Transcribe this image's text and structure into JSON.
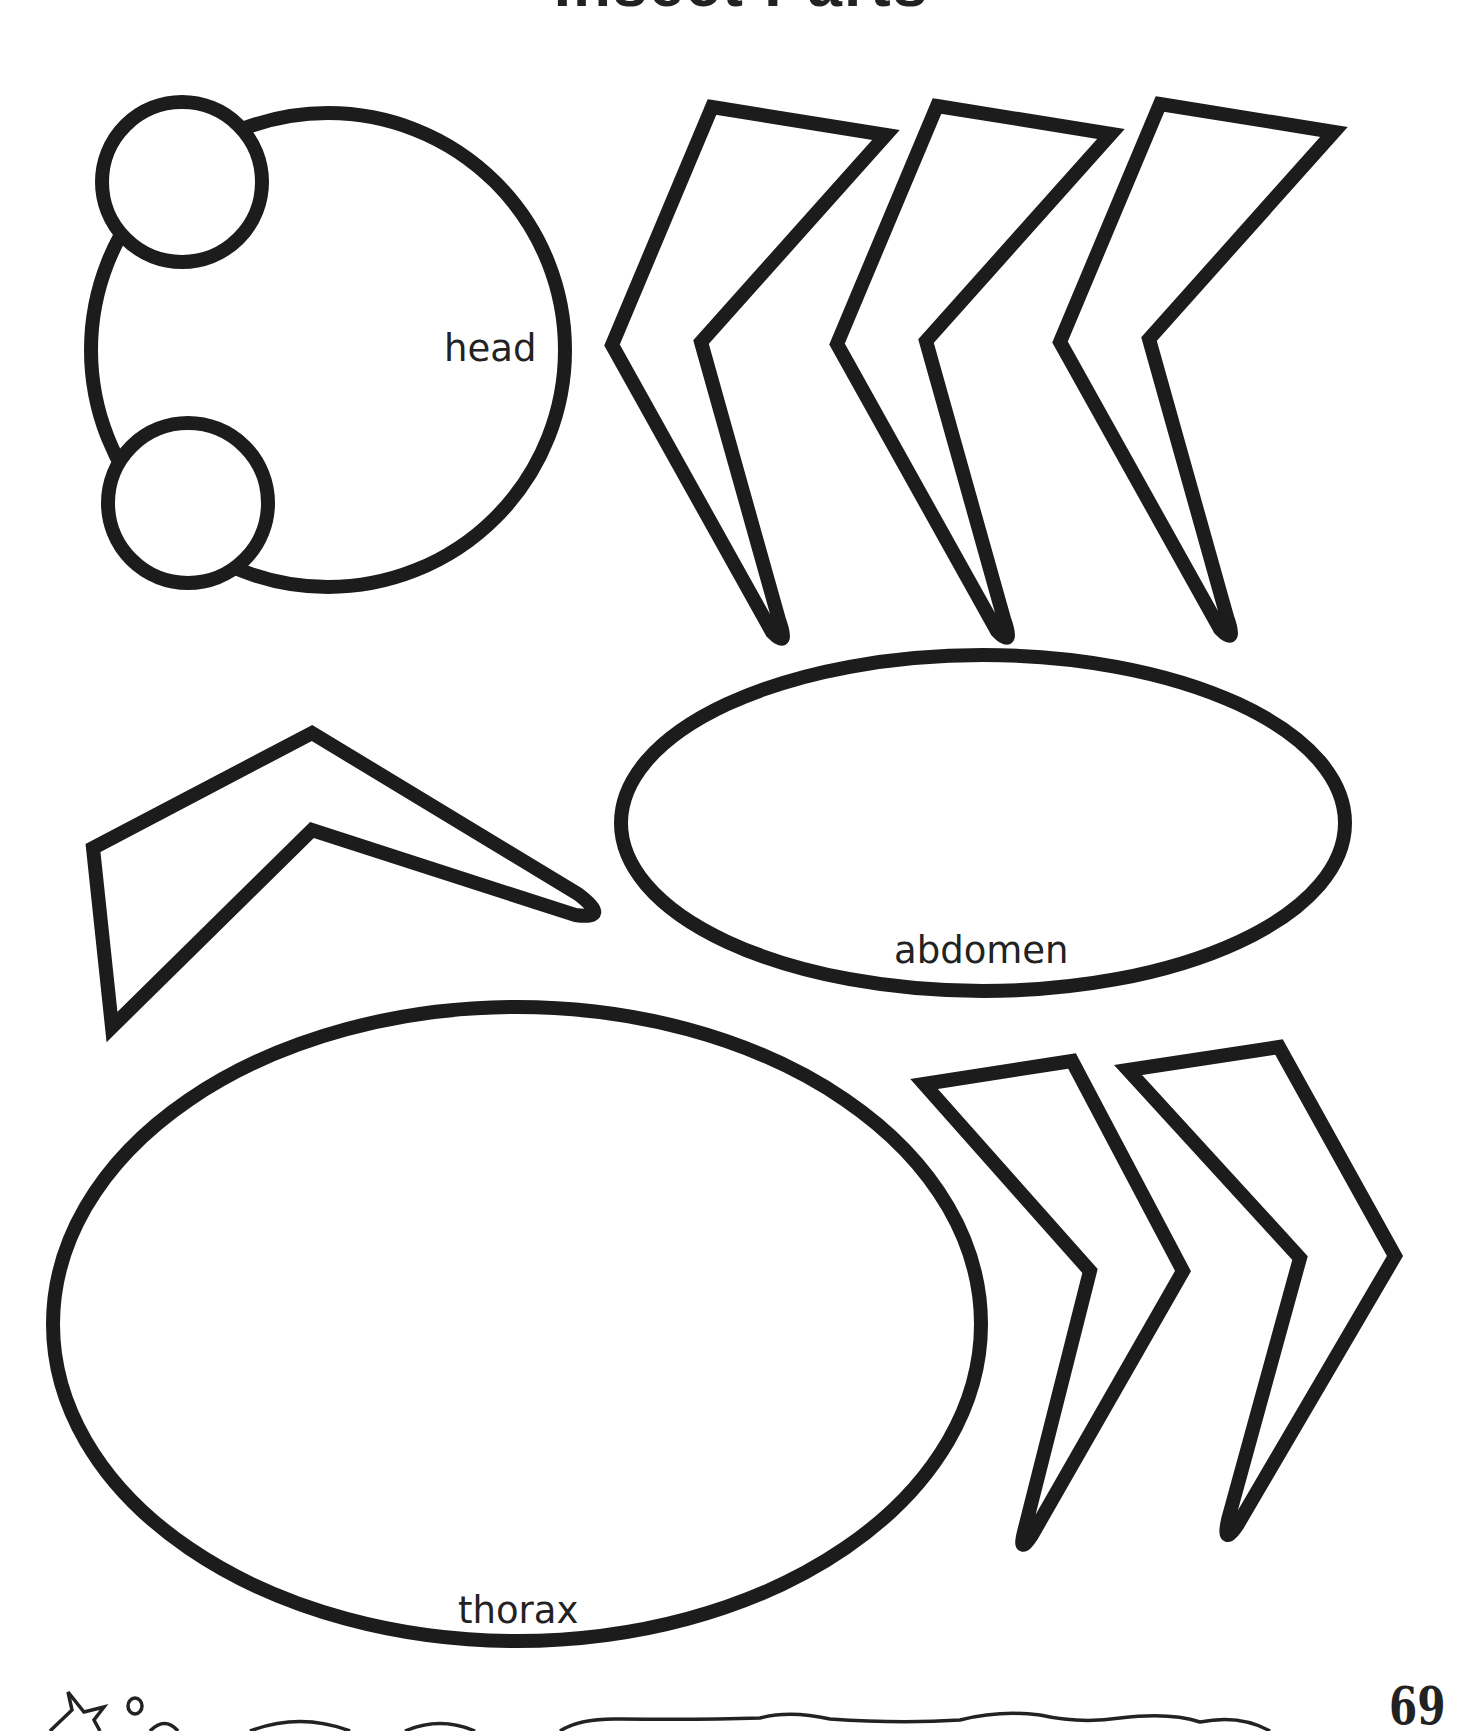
{
  "page": {
    "title": "Insect Parts",
    "page_number": "69"
  },
  "labels": {
    "head": "head",
    "abdomen": "abdomen",
    "thorax": "thorax"
  },
  "parts": {
    "head": {
      "shape": "circle",
      "eyes": 2
    },
    "legs_upper": {
      "count": 3,
      "direction": "left"
    },
    "leg_side": {
      "count": 1,
      "direction": "right"
    },
    "legs_lower": {
      "count": 2,
      "direction": "right"
    },
    "abdomen": {
      "shape": "ellipse"
    },
    "thorax": {
      "shape": "ellipse"
    }
  },
  "footer": {
    "decorations": [
      "star-icon",
      "circle-icon",
      "wavy-border"
    ]
  },
  "colors": {
    "ink": "#1c1c1c",
    "paper": "#ffffff"
  }
}
